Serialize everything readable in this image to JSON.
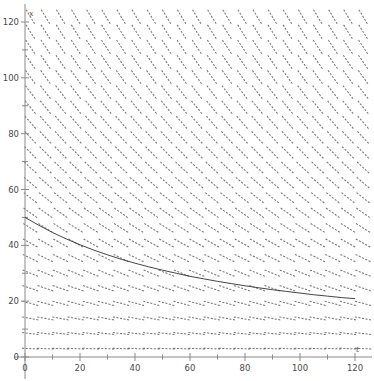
{
  "figure": {
    "width": 374,
    "height": 381,
    "background": "#ffffff",
    "axis_color": "#8a8a8a",
    "field_color": "#5a5a5a",
    "curve_color": "#3a3a3a"
  },
  "chart_data": {
    "type": "line",
    "title": "",
    "subtitle": "",
    "xlabel": "t",
    "ylabel": "x",
    "xlim": [
      0,
      125
    ],
    "ylim": [
      0,
      126
    ],
    "grid": false,
    "legend": null,
    "x_ticks": [
      0,
      20,
      40,
      60,
      80,
      100,
      120
    ],
    "x_tick_labels": [
      "0",
      "20",
      "40",
      "60",
      "80",
      "100",
      "120"
    ],
    "x_minor_step": 10,
    "y_ticks": [
      0,
      20,
      40,
      60,
      80,
      100,
      120
    ],
    "y_tick_labels": [
      "0",
      "20",
      "40",
      "60",
      "80",
      "100",
      "120"
    ],
    "y_minor_step": 10,
    "plot_kind": "slope-field-with-solution",
    "slope_field": {
      "description": "Direction field of dx/dt, dashes slope downward to the right; steepness grows with x (vertical coordinate) and is nearly flat near x = 0.",
      "t_start": 2,
      "t_step": 5.5,
      "t_count": 23,
      "x_start": 3,
      "x_step": 5.4,
      "x_count": 23,
      "segment_length_px": 17,
      "slope_formula": "dx/dt = -0.0135 * x",
      "slope_samples": [
        {
          "x": 120,
          "slope": -1.62
        },
        {
          "x": 100,
          "slope": -1.35
        },
        {
          "x": 80,
          "slope": -1.08
        },
        {
          "x": 60,
          "slope": -0.81
        },
        {
          "x": 40,
          "slope": -0.54
        },
        {
          "x": 20,
          "slope": -0.27
        },
        {
          "x": 5,
          "slope": -0.07
        }
      ]
    },
    "series": [
      {
        "name": "solution",
        "comment": "Particular solution curve passing from x ~ 50 at t = 0 decaying to x ~ 20 at t = 120",
        "x": [
          0,
          5,
          10,
          15,
          20,
          25,
          30,
          35,
          40,
          45,
          50,
          55,
          60,
          65,
          70,
          75,
          80,
          85,
          90,
          95,
          100,
          105,
          110,
          115,
          120
        ],
        "values": [
          50.0,
          47.2,
          44.6,
          42.3,
          40.2,
          38.3,
          36.6,
          35.0,
          33.6,
          32.3,
          31.1,
          30.0,
          28.9,
          28.0,
          27.1,
          26.3,
          25.5,
          24.8,
          24.1,
          23.5,
          22.9,
          22.3,
          21.8,
          21.3,
          20.9
        ]
      }
    ]
  }
}
